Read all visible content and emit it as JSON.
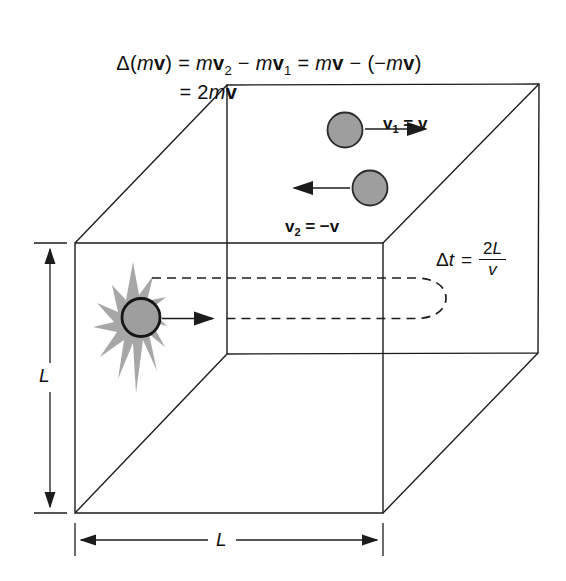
{
  "colors": {
    "background": "#ffffff",
    "line": "#1c1c1c",
    "ball_fill": "#9e9e9e",
    "ball_outline": "#2a2a2a",
    "burst_fill": "#a7a7a7",
    "text": "#111111"
  },
  "equations": {
    "momentum_change": {
      "line1": [
        "Δ(",
        "m",
        "v",
        ") = ",
        "m",
        "v",
        "2",
        " − ",
        "m",
        "v",
        "1",
        " = ",
        "m",
        "v",
        " − (−",
        "m",
        "v",
        ")"
      ],
      "line2": [
        "= 2",
        "m",
        "v"
      ]
    },
    "transit_time": {
      "delta": "Δ",
      "variable": "t",
      "equals": "=",
      "numerator_coefficient": "2",
      "numerator_variable": "L",
      "denominator": "v"
    }
  },
  "labels": {
    "v1": {
      "vector": "v",
      "subscript": "1",
      "equals": " = ",
      "value": "v"
    },
    "v2": {
      "vector": "v",
      "subscript": "2",
      "equals": " = −",
      "value": "v"
    },
    "height_dimension": "L",
    "width_dimension": "L"
  }
}
